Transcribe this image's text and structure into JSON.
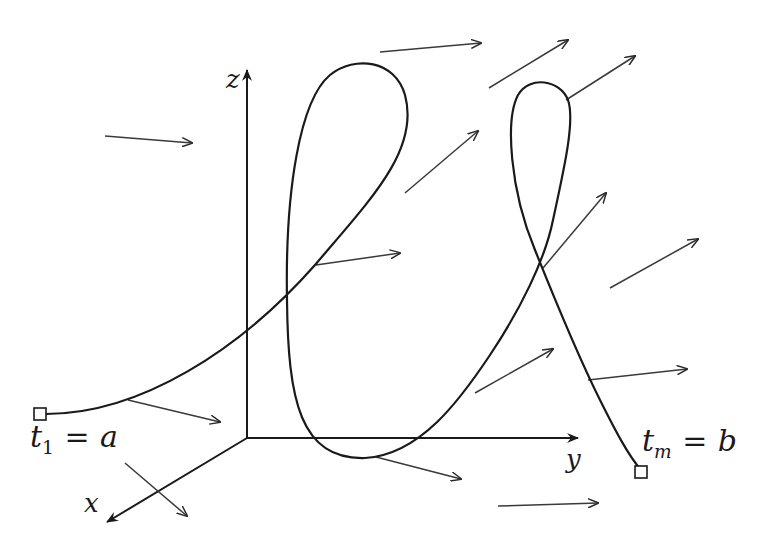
{
  "diagram": {
    "colors": {
      "background": "#ffffff",
      "curve": "#1a1a1a",
      "axes": "#1a1a1a",
      "field_arrows": "#3a3a3a"
    },
    "axes": {
      "origin": [
        247,
        438
      ],
      "x": {
        "label": "x",
        "end": [
          105,
          523
        ]
      },
      "y": {
        "label": "y",
        "end": [
          580,
          438
        ]
      },
      "z": {
        "label": "z",
        "end": [
          247,
          68
        ]
      }
    },
    "endpoints": {
      "start": {
        "var": "t",
        "sub": "1",
        "eq": "=",
        "value": "a",
        "marker": [
          40,
          414
        ]
      },
      "end": {
        "var": "t",
        "sub": "m",
        "eq": "=",
        "value": "b",
        "marker": [
          641,
          470
        ]
      }
    },
    "field_arrows": [
      {
        "from": [
          105,
          136
        ],
        "to": [
          192,
          143
        ]
      },
      {
        "from": [
          380,
          52
        ],
        "to": [
          481,
          43
        ]
      },
      {
        "from": [
          489,
          88
        ],
        "to": [
          568,
          40
        ]
      },
      {
        "from": [
          566,
          100
        ],
        "to": [
          635,
          56
        ]
      },
      {
        "from": [
          405,
          193
        ],
        "to": [
          478,
          131
        ]
      },
      {
        "from": [
          543,
          268
        ],
        "to": [
          606,
          193
        ]
      },
      {
        "from": [
          610,
          288
        ],
        "to": [
          698,
          239
        ]
      },
      {
        "from": [
          316,
          265
        ],
        "to": [
          400,
          253
        ]
      },
      {
        "from": [
          128,
          400
        ],
        "to": [
          220,
          422
        ]
      },
      {
        "from": [
          125,
          463
        ],
        "to": [
          187,
          516
        ]
      },
      {
        "from": [
          376,
          457
        ],
        "to": [
          461,
          479
        ]
      },
      {
        "from": [
          475,
          393
        ],
        "to": [
          553,
          349
        ]
      },
      {
        "from": [
          588,
          380
        ],
        "to": [
          687,
          369
        ]
      },
      {
        "from": [
          498,
          506
        ],
        "to": [
          598,
          503
        ]
      }
    ]
  }
}
